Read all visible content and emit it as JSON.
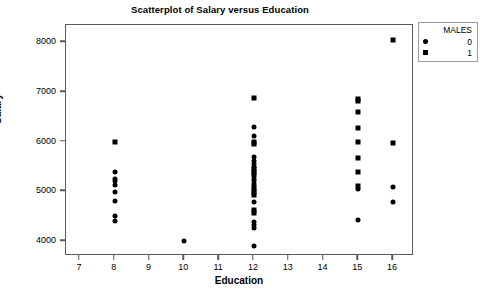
{
  "chart_data": {
    "type": "scatter",
    "title": "Scatterplot of Salary versus Education",
    "xlabel": "Education",
    "ylabel": "Salary",
    "xlim": [
      6.6,
      16.6
    ],
    "ylim": [
      3700,
      8350
    ],
    "xticks": [
      7,
      8,
      9,
      10,
      11,
      12,
      13,
      14,
      15,
      16
    ],
    "yticks": [
      4000,
      5000,
      6000,
      7000,
      8000
    ],
    "grid": false,
    "legend": {
      "title": "MALES",
      "position": "top-right-outside",
      "entries": [
        {
          "label": "0",
          "marker": "circle"
        },
        {
          "label": "1",
          "marker": "square"
        }
      ]
    },
    "series": [
      {
        "name": "0",
        "marker": "circle",
        "points": [
          {
            "x": 8,
            "y": 5400
          },
          {
            "x": 8,
            "y": 5250
          },
          {
            "x": 8,
            "y": 5200
          },
          {
            "x": 8,
            "y": 5120
          },
          {
            "x": 8,
            "y": 4980
          },
          {
            "x": 8,
            "y": 4800
          },
          {
            "x": 8,
            "y": 4500
          },
          {
            "x": 8,
            "y": 4400
          },
          {
            "x": 10,
            "y": 4010
          },
          {
            "x": 12,
            "y": 6290
          },
          {
            "x": 12,
            "y": 6110
          },
          {
            "x": 12,
            "y": 5700
          },
          {
            "x": 12,
            "y": 5620
          },
          {
            "x": 12,
            "y": 5560
          },
          {
            "x": 12,
            "y": 5500
          },
          {
            "x": 12,
            "y": 5260
          },
          {
            "x": 12,
            "y": 5200
          },
          {
            "x": 12,
            "y": 5150
          },
          {
            "x": 12,
            "y": 5100
          },
          {
            "x": 12,
            "y": 4790
          },
          {
            "x": 12,
            "y": 4390
          },
          {
            "x": 12,
            "y": 4320
          },
          {
            "x": 12,
            "y": 4260
          },
          {
            "x": 12,
            "y": 3910
          },
          {
            "x": 15,
            "y": 5040
          },
          {
            "x": 15,
            "y": 4420
          },
          {
            "x": 16,
            "y": 5080
          },
          {
            "x": 16,
            "y": 4780
          }
        ]
      },
      {
        "name": "1",
        "marker": "square",
        "points": [
          {
            "x": 8,
            "y": 6000
          },
          {
            "x": 12,
            "y": 6890
          },
          {
            "x": 12,
            "y": 6000
          },
          {
            "x": 12,
            "y": 5960
          },
          {
            "x": 12,
            "y": 5460
          },
          {
            "x": 12,
            "y": 5400
          },
          {
            "x": 12,
            "y": 5340
          },
          {
            "x": 12,
            "y": 5050
          },
          {
            "x": 12,
            "y": 4990
          },
          {
            "x": 12,
            "y": 4930
          },
          {
            "x": 12,
            "y": 4630
          },
          {
            "x": 12,
            "y": 4560
          },
          {
            "x": 15,
            "y": 6860
          },
          {
            "x": 15,
            "y": 6830
          },
          {
            "x": 15,
            "y": 6600
          },
          {
            "x": 15,
            "y": 6280
          },
          {
            "x": 15,
            "y": 5990
          },
          {
            "x": 15,
            "y": 5680
          },
          {
            "x": 15,
            "y": 5400
          },
          {
            "x": 15,
            "y": 5100
          },
          {
            "x": 16,
            "y": 8050
          },
          {
            "x": 16,
            "y": 5980
          }
        ]
      }
    ]
  }
}
